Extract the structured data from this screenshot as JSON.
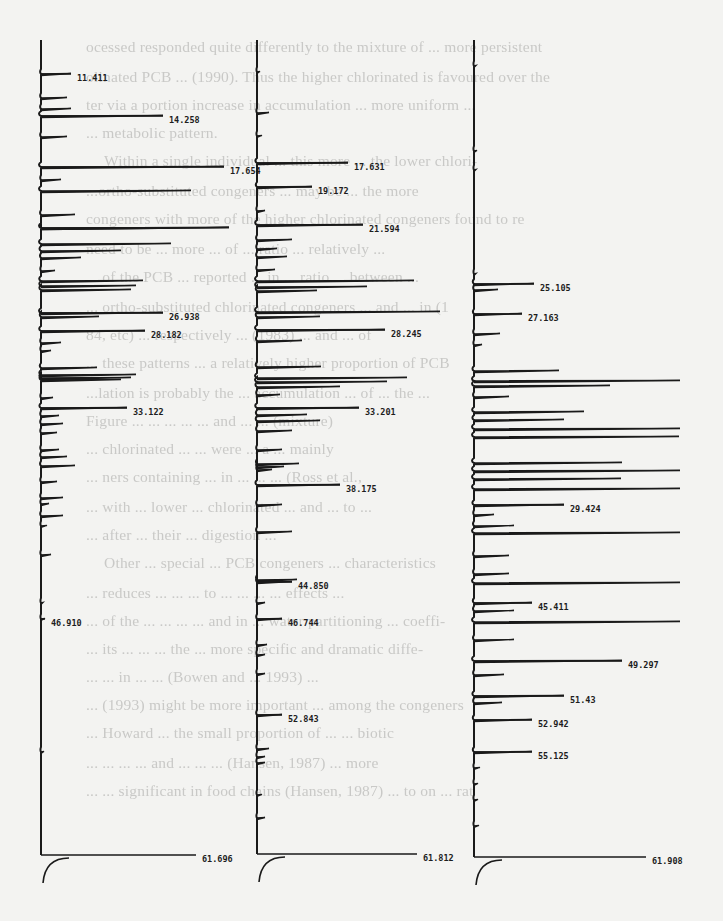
{
  "page": {
    "type": "scanned-document-page"
  },
  "bleed_through_text": [
    {
      "text": "ocessed responded quite differently to the mixture of ... more persistent",
      "x": 86,
      "y": 50
    },
    {
      "text": "olinated PCB ... (1990). Thus the higher chlorinated is favoured over the",
      "x": 86,
      "y": 80
    },
    {
      "text": "ter via a portion increase in accumulation ... more uniform ... ",
      "x": 86,
      "y": 108
    },
    {
      "text": "... metabolic pattern.",
      "x": 86,
      "y": 136
    },
    {
      "text": "Within a single individual ... this more ... the lower chlori-",
      "x": 104,
      "y": 164
    },
    {
      "text": "...ortho-substituted congeners ... may be ... the more",
      "x": 86,
      "y": 194
    },
    {
      "text": "congeners with more of the higher chlorinated congeners found to re",
      "x": 86,
      "y": 222
    },
    {
      "text": "need to be ... more ... of ... ratio ... relatively ...",
      "x": 86,
      "y": 252
    },
    {
      "text": "... of the PCB ... reported ... in ... ratio ... between ...",
      "x": 86,
      "y": 280
    },
    {
      "text": "... ortho-substituted chlorinated congeners ... and ... in (1",
      "x": 86,
      "y": 310
    },
    {
      "text": "84, etc) ... respectively ... (1983) ... and ... of",
      "x": 86,
      "y": 338
    },
    {
      "text": "... these patterns ... a relatively higher proportion of PCB",
      "x": 86,
      "y": 366
    },
    {
      "text": "...lation is probably the ... accumulation ... of ... the ...",
      "x": 86,
      "y": 396
    },
    {
      "text": "Figure ... ... ... ... ... and ... ... (mixture)",
      "x": 86,
      "y": 424
    },
    {
      "text": "... chlorinated ... ... were ... a ... mainly",
      "x": 86,
      "y": 452
    },
    {
      "text": "... ners containing ... in ... ... ... (Ross et al.,",
      "x": 86,
      "y": 480
    },
    {
      "text": "... with ... lower ... chlorinated ... and ... to ...",
      "x": 86,
      "y": 510
    },
    {
      "text": "... after ... their ... digestion ...",
      "x": 86,
      "y": 538
    },
    {
      "text": "Other ... special ... PCB congeners ... characteristics",
      "x": 104,
      "y": 566
    },
    {
      "text": "... reduces ... ... ... to ... ... ... ... effects ...",
      "x": 86,
      "y": 596
    },
    {
      "text": "... of the ... ... ... ... and in ... water partitioning ... coeffi-",
      "x": 86,
      "y": 624
    },
    {
      "text": "... its ... ... ... the ... more specific and dramatic diffe-",
      "x": 86,
      "y": 652
    },
    {
      "text": "... ... in ... ... (Bowen and ... 1993) ...",
      "x": 86,
      "y": 680
    },
    {
      "text": "... (1993) might be more important ... among the congeners",
      "x": 86,
      "y": 708
    },
    {
      "text": "... Howard ... the small proportion of ... ... biotic",
      "x": 86,
      "y": 736
    },
    {
      "text": "... ... ... ... and ... ... ... (Hansen, 1987) ... more",
      "x": 86,
      "y": 766
    },
    {
      "text": "... ... significant in food chains (Hansen, 1987) ... to on ... rat",
      "x": 86,
      "y": 794
    }
  ],
  "chart_data": [
    {
      "type": "line",
      "title": "Chromatogram A (left)",
      "orientation": "vertical time axis, peaks extend to the right",
      "xlabel": "",
      "ylabel": "Retention time (min)",
      "ylim": [
        10,
        62
      ],
      "labelled_peaks": [
        {
          "rt": "11.411",
          "y_px": 74,
          "peak_len": 30
        },
        {
          "rt": "14.258",
          "y_px": 116,
          "peak_len": 122
        },
        {
          "rt": "17.654",
          "y_px": 167,
          "peak_len": 183
        },
        {
          "rt": "26.938",
          "y_px": 313,
          "peak_len": 122
        },
        {
          "rt": "28.182",
          "y_px": 331,
          "peak_len": 104
        },
        {
          "rt": "33.122",
          "y_px": 408,
          "peak_len": 86
        },
        {
          "rt": "46.910",
          "y_px": 619,
          "peak_len": 4
        },
        {
          "rt": "61.696",
          "y_px": 855,
          "peak_len": 155
        }
      ],
      "axis": {
        "x_px": 41,
        "top_px": 40,
        "bottom_px": 855
      },
      "peaks": [
        [
          74,
          30
        ],
        [
          98,
          26
        ],
        [
          109,
          30
        ],
        [
          116,
          122
        ],
        [
          137,
          26
        ],
        [
          167,
          183
        ],
        [
          180,
          20
        ],
        [
          191,
          150
        ],
        [
          215,
          34
        ],
        [
          228,
          188
        ],
        [
          228,
          188
        ],
        [
          244,
          130
        ],
        [
          251,
          80
        ],
        [
          258,
          40
        ],
        [
          271,
          14
        ],
        [
          281,
          102
        ],
        [
          286,
          95
        ],
        [
          290,
          90
        ],
        [
          313,
          122
        ],
        [
          317,
          58
        ],
        [
          331,
          104
        ],
        [
          343,
          20
        ],
        [
          351,
          10
        ],
        [
          368,
          56
        ],
        [
          375,
          95
        ],
        [
          378,
          90
        ],
        [
          380,
          80
        ],
        [
          398,
          12
        ],
        [
          408,
          86
        ],
        [
          416,
          18
        ],
        [
          424,
          22
        ],
        [
          433,
          16
        ],
        [
          450,
          18
        ],
        [
          457,
          26
        ],
        [
          466,
          34
        ],
        [
          482,
          16
        ],
        [
          498,
          22
        ],
        [
          504,
          8
        ],
        [
          516,
          22
        ],
        [
          526,
          6
        ],
        [
          555,
          10
        ],
        [
          603,
          2
        ],
        [
          619,
          4
        ],
        [
          752,
          3
        ]
      ]
    },
    {
      "type": "line",
      "title": "Chromatogram B (middle)",
      "orientation": "vertical time axis, peaks extend to the right",
      "xlabel": "",
      "ylabel": "Retention time (min)",
      "ylim": [
        10,
        62
      ],
      "labelled_peaks": [
        {
          "rt": "17.631",
          "y_px": 163,
          "peak_len": 91
        },
        {
          "rt": "19.172",
          "y_px": 187,
          "peak_len": 55
        },
        {
          "rt": "21.594",
          "y_px": 225,
          "peak_len": 106
        },
        {
          "rt": "28.245",
          "y_px": 330,
          "peak_len": 128
        },
        {
          "rt": "33.201",
          "y_px": 408,
          "peak_len": 102
        },
        {
          "rt": "38.175",
          "y_px": 485,
          "peak_len": 83
        },
        {
          "rt": "44.850",
          "y_px": 582,
          "peak_len": 35
        },
        {
          "rt": "46.744",
          "y_px": 619,
          "peak_len": 25
        },
        {
          "rt": "52.843",
          "y_px": 715,
          "peak_len": 25
        },
        {
          "rt": "61.812",
          "y_px": 854,
          "peak_len": 160
        }
      ],
      "axis": {
        "x_px": 257,
        "top_px": 40,
        "bottom_px": 854
      },
      "peaks": [
        [
          72,
          3
        ],
        [
          113,
          12
        ],
        [
          136,
          5
        ],
        [
          163,
          91
        ],
        [
          187,
          55
        ],
        [
          211,
          8
        ],
        [
          225,
          106
        ],
        [
          240,
          35
        ],
        [
          249,
          20
        ],
        [
          257,
          30
        ],
        [
          270,
          18
        ],
        [
          281,
          157
        ],
        [
          287,
          110
        ],
        [
          291,
          60
        ],
        [
          312,
          183
        ],
        [
          317,
          63
        ],
        [
          330,
          128
        ],
        [
          341,
          45
        ],
        [
          367,
          64
        ],
        [
          378,
          150
        ],
        [
          382,
          130
        ],
        [
          387,
          83
        ],
        [
          395,
          23
        ],
        [
          408,
          102
        ],
        [
          415,
          50
        ],
        [
          421,
          63
        ],
        [
          431,
          35
        ],
        [
          450,
          25
        ],
        [
          464,
          42
        ],
        [
          467,
          27
        ],
        [
          470,
          15
        ],
        [
          485,
          83
        ],
        [
          505,
          25
        ],
        [
          532,
          35
        ],
        [
          580,
          40
        ],
        [
          582,
          35
        ],
        [
          603,
          8
        ],
        [
          619,
          25
        ],
        [
          645,
          10
        ],
        [
          655,
          8
        ],
        [
          674,
          8
        ],
        [
          715,
          25
        ],
        [
          749,
          12
        ],
        [
          757,
          8
        ],
        [
          763,
          8
        ],
        [
          795,
          5
        ],
        [
          818,
          8
        ]
      ]
    },
    {
      "type": "line",
      "title": "Chromatogram C (right)",
      "orientation": "vertical time axis, peaks extend to the right",
      "xlabel": "",
      "ylabel": "Retention time (min)",
      "ylim": [
        10,
        62
      ],
      "labelled_peaks": [
        {
          "rt": "25.105",
          "y_px": 284,
          "peak_len": 60
        },
        {
          "rt": "27.163",
          "y_px": 314,
          "peak_len": 48
        },
        {
          "rt": "29.424",
          "y_px": 505,
          "peak_len": 90
        },
        {
          "rt": "45.411",
          "y_px": 603,
          "peak_len": 58
        },
        {
          "rt": "49.297",
          "y_px": 661,
          "peak_len": 148
        },
        {
          "rt": "51.43",
          "y_px": 696,
          "peak_len": 90
        },
        {
          "rt": "52.942",
          "y_px": 720,
          "peak_len": 58
        },
        {
          "rt": "55.125",
          "y_px": 752,
          "peak_len": 58
        },
        {
          "rt": "61.908",
          "y_px": 857,
          "peak_len": 172
        }
      ],
      "axis": {
        "x_px": 474,
        "top_px": 40,
        "bottom_px": 857
      },
      "peaks": [
        [
          66,
          2
        ],
        [
          151,
          3
        ],
        [
          170,
          2
        ],
        [
          274,
          2
        ],
        [
          284,
          60
        ],
        [
          290,
          24
        ],
        [
          314,
          48
        ],
        [
          334,
          26
        ],
        [
          345,
          8
        ],
        [
          371,
          85
        ],
        [
          381,
          206
        ],
        [
          386,
          136
        ],
        [
          397,
          35
        ],
        [
          412,
          110
        ],
        [
          420,
          90
        ],
        [
          429,
          206
        ],
        [
          437,
          205
        ],
        [
          463,
          148
        ],
        [
          471,
          206
        ],
        [
          479,
          147
        ],
        [
          489,
          206
        ],
        [
          505,
          90
        ],
        [
          515,
          20
        ],
        [
          526,
          40
        ],
        [
          533,
          206
        ],
        [
          556,
          35
        ],
        [
          574,
          35
        ],
        [
          583,
          206
        ],
        [
          603,
          58
        ],
        [
          611,
          40
        ],
        [
          622,
          206
        ],
        [
          640,
          40
        ],
        [
          661,
          148
        ],
        [
          675,
          30
        ],
        [
          696,
          90
        ],
        [
          703,
          28
        ],
        [
          720,
          58
        ],
        [
          752,
          58
        ],
        [
          768,
          6
        ],
        [
          784,
          4
        ],
        [
          800,
          4
        ],
        [
          826,
          5
        ]
      ]
    }
  ]
}
